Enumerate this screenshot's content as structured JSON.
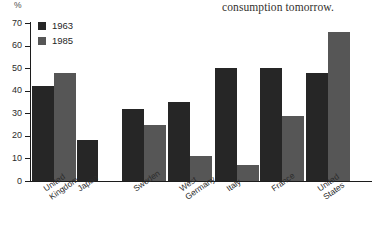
{
  "page_caption": "consumption tomorrow.",
  "chart": {
    "y_unit_label": "%",
    "legend": [
      {
        "label": "1963",
        "color": "#262626"
      },
      {
        "label": "1985",
        "color": "#565656"
      }
    ],
    "y_ticks": [
      "0",
      "10",
      "20",
      "30",
      "40",
      "50",
      "60",
      "70"
    ]
  },
  "chart_data": {
    "type": "bar",
    "title": "",
    "xlabel": "",
    "ylabel": "%",
    "ylim": [
      0,
      70
    ],
    "grid": false,
    "legend_position": "top-left",
    "categories": [
      "United Kingdom",
      "Japan",
      "Sweden",
      "West Germany",
      "Italy",
      "France",
      "United States"
    ],
    "series": [
      {
        "name": "1963",
        "color": "#262626",
        "values": [
          42,
          18,
          32,
          35,
          50,
          50,
          48
        ]
      },
      {
        "name": "1985",
        "color": "#565656",
        "values": [
          48,
          null,
          25,
          11,
          7,
          29,
          66
        ]
      }
    ],
    "y_tick_values": [
      0,
      10,
      20,
      30,
      40,
      50,
      60,
      70
    ]
  }
}
